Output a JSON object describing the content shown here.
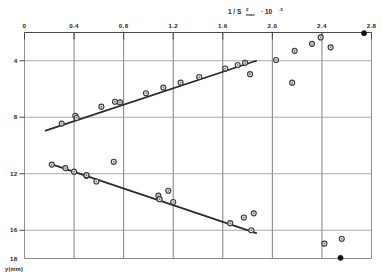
{
  "chart_data": {
    "type": "scatter",
    "title": "",
    "xlabel": "1 / S²max · 10⁻⁵",
    "xlabel_parts": {
      "prefix": "1 / S",
      "exponent": "2",
      "subscript": "max",
      "middle": "· 10",
      "power": "-5"
    },
    "ylabel": "y(mm)",
    "xlim": [
      0,
      2.8
    ],
    "ylim": [
      2,
      18
    ],
    "y_axis_inverted": true,
    "x_axis_position": "top",
    "y_axis_position": "left",
    "grid": true,
    "legend": "none",
    "xticks": [
      0,
      0.4,
      0.8,
      1.2,
      1.6,
      2.0,
      2.4,
      2.8
    ],
    "xticklabels": [
      "0",
      "0.4",
      "0.8",
      "1.2",
      "1.6",
      "2.0",
      "2.4",
      "2.8"
    ],
    "yticks": [
      4,
      8,
      12,
      16,
      18
    ],
    "yticklabels": [
      "4",
      "8",
      "12",
      "16",
      "18"
    ],
    "gridlines_x": [
      0.4,
      0.8,
      1.2,
      1.6,
      2.0,
      2.4
    ],
    "gridlines_y": [
      4,
      8,
      12,
      16
    ],
    "series": [
      {
        "name": "upper-branch",
        "marker": "open-circle",
        "points": [
          [
            0.3,
            8.45
          ],
          [
            0.41,
            7.9
          ],
          [
            0.42,
            8.05
          ],
          [
            0.62,
            7.25
          ],
          [
            0.73,
            6.9
          ],
          [
            0.77,
            6.95
          ],
          [
            0.98,
            6.3
          ],
          [
            1.12,
            5.9
          ],
          [
            1.26,
            5.55
          ],
          [
            1.41,
            5.15
          ],
          [
            1.62,
            4.55
          ],
          [
            1.72,
            4.3
          ],
          [
            1.78,
            4.15
          ]
        ]
      },
      {
        "name": "lower-branch",
        "marker": "open-circle",
        "points": [
          [
            0.22,
            11.35
          ],
          [
            0.33,
            11.6
          ],
          [
            0.4,
            11.85
          ],
          [
            0.5,
            12.15
          ],
          [
            0.5,
            12.1
          ],
          [
            0.58,
            12.55
          ],
          [
            1.08,
            13.55
          ],
          [
            1.09,
            13.8
          ],
          [
            1.2,
            14.0
          ],
          [
            1.66,
            15.5
          ],
          [
            1.83,
            16.0
          ]
        ]
      },
      {
        "name": "scatter-outliers",
        "marker": "open-circle",
        "points": [
          [
            1.82,
            4.95
          ],
          [
            2.03,
            3.95
          ],
          [
            2.18,
            3.3
          ],
          [
            2.16,
            5.55
          ],
          [
            2.32,
            2.8
          ],
          [
            2.39,
            2.35
          ],
          [
            2.47,
            3.05
          ],
          [
            0.72,
            11.15
          ],
          [
            1.16,
            13.2
          ],
          [
            1.77,
            15.1
          ],
          [
            1.85,
            14.8
          ],
          [
            2.42,
            16.95
          ],
          [
            2.56,
            16.6
          ]
        ]
      },
      {
        "name": "axis-filled-markers",
        "marker": "filled-circle",
        "points": [
          [
            2.74,
            2.05
          ],
          [
            2.55,
            17.95
          ]
        ]
      }
    ],
    "fits": [
      {
        "name": "upper-fit-line",
        "x_start": 0.17,
        "y_start": 8.95,
        "x_end": 1.87,
        "y_end": 4.0
      },
      {
        "name": "lower-fit-line",
        "x_start": 0.21,
        "y_start": 11.3,
        "x_end": 1.87,
        "y_end": 16.2
      }
    ]
  },
  "axes": {
    "x_title_prefix": "1 / S",
    "x_title_sup": "2",
    "x_title_sub": "max",
    "x_title_mid": "· 10",
    "x_title_pow": "-5",
    "y_title": "y(mm)",
    "xticklabels": [
      "0",
      "0.4",
      "0.8",
      "1.2",
      "1.6",
      "2.0",
      "2.4",
      "2.8"
    ],
    "yticklabels": [
      "4",
      "8",
      "12",
      "16",
      "18"
    ]
  }
}
